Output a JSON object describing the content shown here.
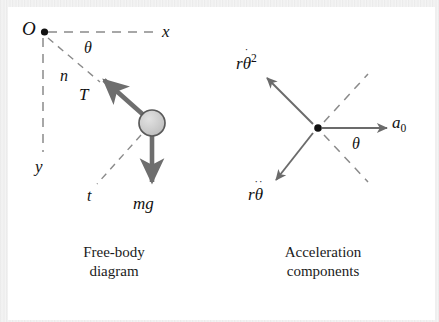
{
  "figure": {
    "title_left": "Free-body\ndiagram",
    "title_right": "Acceleration\ncomponents",
    "colors": {
      "page_background": "#ffffff",
      "frame_background": "#f0f0f0",
      "ink": "#111111",
      "heavy_vector": "#6e6e6e",
      "thin_vector": "#6b6b6b",
      "dashed_axis": "#8a8a8a",
      "ball_fill": "#cfcfcf",
      "ball_stroke": "#5a5a5a"
    }
  },
  "free_body": {
    "origin_label": "O",
    "axis_x_label": "x",
    "axis_y_label": "y",
    "axis_n_label": "n",
    "axis_t_label": "t",
    "angle_label": "θ",
    "tension_label": "T",
    "weight_label": "mg",
    "elements": {
      "origin_dot": "origin-dot",
      "ball": "particle-ball",
      "cord": "cord-line",
      "tension_arrow": "tension-arrow",
      "weight_arrow": "weight-arrow"
    }
  },
  "acceleration": {
    "center_label": "",
    "angle_label": "θ",
    "a0_base": "a",
    "a0_sub": "0",
    "normal_term": {
      "r": "r",
      "theta": "θ",
      "dots": "˙",
      "power": "2"
    },
    "tangential_term": {
      "r": "r",
      "theta": "θ",
      "dots": "˙˙"
    },
    "elements": {
      "center_dot": "center-dot",
      "a0_arrow": "a0-arrow",
      "normal_arrow": "normal-accel-arrow",
      "tangential_arrow": "tangential-accel-arrow",
      "dashed_axis_upper": "dashed-axis-upper",
      "dashed_axis_lower": "dashed-axis-lower"
    }
  }
}
